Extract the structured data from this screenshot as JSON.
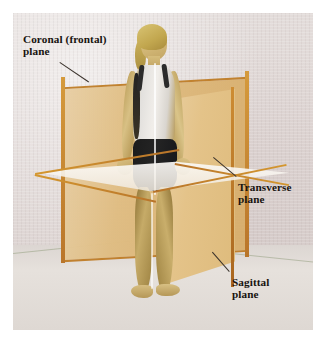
{
  "figure": {
    "kind": "anatomical-planes-photograph",
    "subject_description": "Standing female figure in white tank top and black shorts, arms slightly away from body, bare feet",
    "background_color": "#ded5d3",
    "plate_border_color": "#ffffff"
  },
  "planes": [
    {
      "id": "coronal",
      "label": "Coronal (frontal)\nplane",
      "orientation": "vertical-frontal",
      "fill_color": "#dcb678",
      "edge_color": "#c07f2a"
    },
    {
      "id": "transverse",
      "label": "Transverse\nplane",
      "orientation": "horizontal",
      "fill_color": "#f5f1ea",
      "edge_color": "#c08a2c"
    },
    {
      "id": "sagittal",
      "label": "Sagittal\nplane",
      "orientation": "vertical-median",
      "fill_color": "#e4c389",
      "edge_color": "#b8742a"
    }
  ],
  "labels": {
    "coronal": "Coronal (frontal)\nplane",
    "transverse": "Transverse\nplane",
    "sagittal": "Sagittal\nplane"
  },
  "caption": {
    "clipped_text": "",
    "visible": "partial"
  }
}
